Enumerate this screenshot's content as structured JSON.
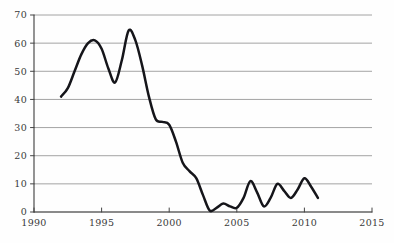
{
  "chart_data": {
    "type": "line",
    "title": "",
    "subtitle": "",
    "xlabel": "",
    "ylabel": "",
    "xlim": [
      1990,
      2015
    ],
    "ylim": [
      0,
      70
    ],
    "grid": true,
    "legend": false,
    "legend_position": "none",
    "x_ticks": [
      "1990",
      "1995",
      "2000",
      "2005",
      "2010",
      "2015"
    ],
    "x_tick_values": [
      1990,
      1995,
      2000,
      2005,
      2010,
      2015
    ],
    "y_ticks": [
      "0",
      "10",
      "20",
      "30",
      "40",
      "50",
      "60",
      "70"
    ],
    "y_tick_values": [
      0,
      10,
      20,
      30,
      40,
      50,
      60,
      70
    ],
    "series": [
      {
        "name": "value",
        "color": "#15151a",
        "x": [
          1992,
          1992.5,
          1993,
          1993.5,
          1994,
          1994.5,
          1995,
          1995.5,
          1996,
          1996.5,
          1997,
          1997.5,
          1998,
          1998.5,
          1999,
          1999.5,
          2000,
          2000.5,
          2001,
          2001.5,
          2002,
          2002.5,
          2003,
          2003.5,
          2004,
          2004.5,
          2005,
          2005.5,
          2006,
          2006.5,
          2007,
          2007.5,
          2008,
          2008.5,
          2009,
          2009.5,
          2010,
          2010.5,
          2011
        ],
        "values": [
          41,
          44,
          50,
          56,
          60,
          61,
          58,
          51,
          46,
          54,
          64.5,
          61,
          52,
          41,
          33,
          32,
          31,
          25,
          17.5,
          14.5,
          12,
          6,
          0.5,
          1.5,
          3,
          2,
          1.5,
          5,
          11,
          7,
          2,
          5,
          10,
          7.5,
          5,
          8,
          12,
          9,
          5
        ]
      }
    ],
    "annotations": []
  },
  "colors": {
    "line": "#15151a",
    "grid": "#9a9a9a",
    "axis": "#444444",
    "tick_label": "#3a3a3a",
    "background": "#fefefe"
  },
  "geometry": {
    "plot_left": 34,
    "plot_right": 372,
    "plot_top": 15,
    "plot_bottom": 212
  }
}
